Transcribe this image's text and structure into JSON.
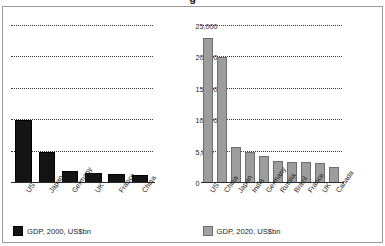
{
  "title_fragment": "g",
  "chart_data": [
    {
      "type": "bar",
      "title": "GDP, 2000, US$bn",
      "categories": [
        "US",
        "Japan",
        "Germany",
        "UK",
        "France",
        "China"
      ],
      "values": [
        10000,
        4900,
        1950,
        1650,
        1370,
        1200
      ],
      "xlabel": "",
      "ylabel": "",
      "ylim": [
        0,
        27000
      ],
      "yticks": [
        0,
        5000,
        10000,
        15000,
        20000,
        25000
      ],
      "ytick_labels": [
        "0",
        "5,000",
        "10,000",
        "15,000",
        "20,000",
        "25,000"
      ],
      "grid": true,
      "legend_position": "bottom-left",
      "legend": [
        "GDP, 2000, US$bn"
      ],
      "series_color": "#141414"
    },
    {
      "type": "bar",
      "title": "GDP, 2020, US$bn",
      "categories": [
        "US",
        "China",
        "Japan",
        "India",
        "Germany",
        "Russia",
        "Brazil",
        "France",
        "UK",
        "Canada"
      ],
      "values": [
        23000,
        20000,
        5700,
        5000,
        4300,
        3500,
        3400,
        3300,
        3100,
        2500
      ],
      "xlabel": "",
      "ylabel": "",
      "ylim": [
        0,
        27000
      ],
      "yticks": [
        0,
        5000,
        10000,
        15000,
        20000,
        25000
      ],
      "ytick_labels": [
        "0",
        "5,000",
        "10,000",
        "15,000",
        "20,000",
        "25,000"
      ],
      "grid": true,
      "legend_position": "bottom-left",
      "legend": [
        "GDP, 2020, US$bn"
      ],
      "series_color": "#9d9d9d"
    }
  ],
  "left_chart": {
    "legend_label": "GDP, 2000, US$bn",
    "categories": [
      "US",
      "Japan",
      "Germany",
      "UK",
      "France",
      "China"
    ],
    "values": [
      10000,
      4900,
      1950,
      1650,
      1370,
      1200
    ],
    "ytick_labels": [
      "0",
      "5,000",
      "10,000",
      "15,000",
      "20,000",
      "25,000"
    ]
  },
  "right_chart": {
    "legend_label": "GDP, 2020, US$bn",
    "categories": [
      "US",
      "China",
      "Japan",
      "India",
      "Germany",
      "Russia",
      "Brazil",
      "France",
      "UK",
      "Canada"
    ],
    "values": [
      23000,
      20000,
      5700,
      5000,
      4300,
      3500,
      3400,
      3300,
      3100,
      2500
    ],
    "ytick_labels": [
      "0",
      "5,000",
      "10,000",
      "15,000",
      "20,000",
      "25,000"
    ]
  },
  "colors": {
    "bar_2000": "#141414",
    "bar_2020": "#9d9d9d",
    "grid": "#3a3a3a",
    "axis": "#2b2b2b",
    "frame": "#9b9b9b",
    "background": "#ffffff",
    "text": "#1d1d1d"
  }
}
